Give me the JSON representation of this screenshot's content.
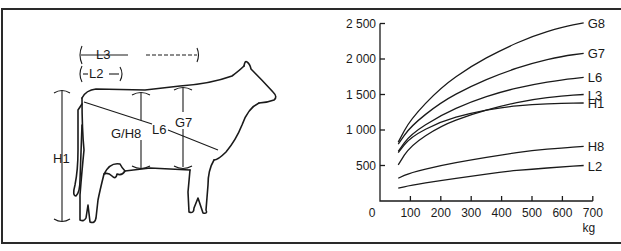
{
  "figure": {
    "left_panel": {
      "title": "Cow body measurements",
      "labels": {
        "L3": "L3",
        "L2": "L2",
        "H1": "H1",
        "G_H8": "G/H8",
        "L6": "L6",
        "G7": "G7"
      }
    },
    "right_panel": {
      "x_unit": "kg",
      "y_ticks": [
        "500",
        "1 000",
        "1 500",
        "2 000",
        "2 500"
      ],
      "x_ticks": [
        "0",
        "100",
        "200",
        "300",
        "400",
        "500",
        "600",
        "700"
      ],
      "series_labels": [
        "G8",
        "G7",
        "L6",
        "L3",
        "H1",
        "H8",
        "L2"
      ]
    }
  },
  "chart_data": {
    "type": "line",
    "title": "",
    "xlabel": "kg",
    "ylabel": "",
    "xlim": [
      0,
      700
    ],
    "ylim": [
      0,
      2500
    ],
    "grid": false,
    "legend_position": "inline-right (labels at line ends)",
    "x": [
      60,
      100,
      200,
      300,
      400,
      500,
      600,
      670
    ],
    "series": [
      {
        "name": "G8",
        "values": [
          830,
          1150,
          1600,
          1900,
          2130,
          2320,
          2450,
          2510
        ]
      },
      {
        "name": "G7",
        "values": [
          800,
          1050,
          1390,
          1620,
          1800,
          1940,
          2040,
          2080
        ]
      },
      {
        "name": "L6",
        "values": [
          700,
          940,
          1210,
          1400,
          1540,
          1640,
          1710,
          1740
        ]
      },
      {
        "name": "L3",
        "values": [
          510,
          780,
          1060,
          1220,
          1340,
          1430,
          1480,
          1500
        ]
      },
      {
        "name": "H1",
        "values": [
          680,
          900,
          1120,
          1240,
          1320,
          1360,
          1375,
          1380
        ]
      },
      {
        "name": "H8",
        "values": [
          320,
          400,
          500,
          580,
          650,
          710,
          750,
          770
        ]
      },
      {
        "name": "L2",
        "values": [
          180,
          220,
          290,
          350,
          410,
          450,
          480,
          500
        ]
      }
    ]
  }
}
